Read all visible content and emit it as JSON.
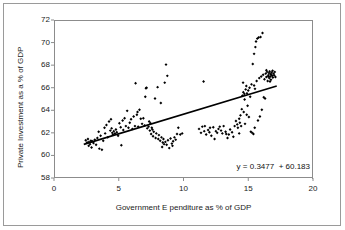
{
  "chart_data": {
    "type": "scatter",
    "title": "",
    "xlabel": "Government E  penditure as % of GDP",
    "ylabel": "Private Investment as a % of GDP",
    "xlim": [
      0,
      20
    ],
    "ylim": [
      58,
      72
    ],
    "xticks": [
      "0",
      "5",
      "10",
      "15",
      "20"
    ],
    "xtick_values": [
      0,
      5,
      10,
      15,
      20
    ],
    "yticks": [
      "58",
      "60",
      "62",
      "64",
      "66",
      "68",
      "70",
      "72"
    ],
    "ytick_values": [
      58,
      60,
      62,
      64,
      66,
      68,
      70,
      72
    ],
    "grid": false,
    "legend": null,
    "marker": "diamond",
    "marker_color": "#000000",
    "annotations": [
      {
        "name": "regression-equation",
        "text": "y = 0.3477  + 60.183",
        "x": 16.2,
        "y": 58.9
      }
    ],
    "trendline": {
      "type": "linear",
      "slope": 0.3477,
      "intercept": 60.183,
      "color": "#000000",
      "x_start": 2.3,
      "x_end": 17.2,
      "y_start": 60.98,
      "y_end": 66.16
    },
    "points": [
      [
        2.45,
        61.35
      ],
      [
        2.55,
        61.15
      ],
      [
        2.62,
        61.45
      ],
      [
        2.7,
        61.2
      ],
      [
        2.78,
        61.0
      ],
      [
        2.85,
        61.3
      ],
      [
        2.9,
        60.7
      ],
      [
        2.95,
        61.25
      ],
      [
        3.05,
        61.1
      ],
      [
        3.15,
        61.4
      ],
      [
        3.25,
        60.95
      ],
      [
        3.35,
        61.55
      ],
      [
        3.45,
        62.1
      ],
      [
        3.5,
        60.6
      ],
      [
        3.6,
        61.75
      ],
      [
        3.7,
        60.5
      ],
      [
        3.8,
        61.3
      ],
      [
        3.95,
        61.95
      ],
      [
        4.05,
        62.7
      ],
      [
        4.15,
        61.6
      ],
      [
        4.25,
        63.0
      ],
      [
        4.35,
        62.2
      ],
      [
        4.45,
        62.4
      ],
      [
        4.5,
        62.0
      ],
      [
        4.55,
        61.85
      ],
      [
        4.62,
        62.15
      ],
      [
        4.7,
        61.95
      ],
      [
        4.78,
        62.3
      ],
      [
        4.85,
        62.05
      ],
      [
        4.95,
        61.75
      ],
      [
        5.05,
        62.85
      ],
      [
        5.15,
        62.5
      ],
      [
        5.2,
        60.9
      ],
      [
        5.3,
        63.1
      ],
      [
        5.45,
        63.3
      ],
      [
        5.55,
        62.6
      ],
      [
        5.65,
        63.95
      ],
      [
        5.75,
        62.45
      ],
      [
        5.85,
        62.9
      ],
      [
        5.95,
        63.2
      ],
      [
        6.05,
        62.35
      ],
      [
        6.15,
        63.45
      ],
      [
        6.25,
        62.6
      ],
      [
        6.3,
        66.4
      ],
      [
        6.4,
        63.6
      ],
      [
        6.5,
        62.55
      ],
      [
        6.6,
        64.05
      ],
      [
        6.7,
        63.25
      ],
      [
        6.8,
        62.8
      ],
      [
        6.9,
        63.3
      ],
      [
        7.0,
        62.65
      ],
      [
        7.05,
        65.2
      ],
      [
        7.1,
        65.95
      ],
      [
        7.15,
        66.0
      ],
      [
        7.2,
        62.4
      ],
      [
        7.3,
        62.55
      ],
      [
        7.35,
        63.0
      ],
      [
        7.4,
        62.2
      ],
      [
        7.5,
        61.9
      ],
      [
        7.55,
        62.45
      ],
      [
        7.6,
        62.3
      ],
      [
        7.65,
        61.7
      ],
      [
        7.7,
        62.1
      ],
      [
        7.8,
        65.05
      ],
      [
        7.85,
        61.55
      ],
      [
        7.9,
        61.95
      ],
      [
        8.0,
        66.05
      ],
      [
        8.05,
        61.45
      ],
      [
        8.1,
        61.8
      ],
      [
        8.2,
        61.3
      ],
      [
        8.25,
        64.65
      ],
      [
        8.3,
        61.6
      ],
      [
        8.4,
        61.15
      ],
      [
        8.45,
        61.45
      ],
      [
        8.5,
        61.0
      ],
      [
        8.55,
        66.45
      ],
      [
        8.6,
        61.2
      ],
      [
        8.65,
        68.05
      ],
      [
        8.7,
        60.95
      ],
      [
        8.75,
        67.05
      ],
      [
        8.8,
        61.35
      ],
      [
        8.9,
        60.65
      ],
      [
        9.0,
        61.5
      ],
      [
        9.1,
        61.05
      ],
      [
        9.2,
        61.25
      ],
      [
        9.3,
        61.6
      ],
      [
        9.4,
        61.4
      ],
      [
        9.5,
        61.9
      ],
      [
        9.6,
        62.45
      ],
      [
        9.75,
        61.85
      ],
      [
        9.9,
        61.95
      ],
      [
        11.2,
        62.35
      ],
      [
        11.35,
        62.0
      ],
      [
        11.45,
        62.55
      ],
      [
        11.55,
        66.55
      ],
      [
        11.6,
        62.15
      ],
      [
        11.75,
        61.85
      ],
      [
        11.9,
        62.25
      ],
      [
        12.0,
        62.05
      ],
      [
        12.15,
        61.75
      ],
      [
        12.3,
        62.5
      ],
      [
        12.4,
        61.45
      ],
      [
        12.5,
        62.15
      ],
      [
        12.6,
        62.0
      ],
      [
        12.7,
        62.35
      ],
      [
        12.8,
        62.55
      ],
      [
        12.9,
        62.2
      ],
      [
        13.0,
        61.95
      ],
      [
        13.1,
        62.6
      ],
      [
        13.25,
        62.1
      ],
      [
        13.4,
        61.55
      ],
      [
        13.5,
        61.85
      ],
      [
        13.6,
        62.3
      ],
      [
        13.75,
        62.05
      ],
      [
        13.85,
        61.65
      ],
      [
        13.95,
        62.6
      ],
      [
        14.05,
        63.05
      ],
      [
        14.15,
        62.75
      ],
      [
        14.2,
        62.45
      ],
      [
        14.3,
        63.25
      ],
      [
        14.35,
        62.9
      ],
      [
        14.4,
        63.55
      ],
      [
        14.45,
        62.6
      ],
      [
        14.5,
        64.1
      ],
      [
        14.55,
        65.3
      ],
      [
        14.6,
        66.45
      ],
      [
        14.62,
        65.6
      ],
      [
        14.65,
        63.85
      ],
      [
        14.7,
        65.45
      ],
      [
        14.72,
        64.95
      ],
      [
        14.75,
        62.8
      ],
      [
        14.8,
        65.85
      ],
      [
        14.85,
        66.15
      ],
      [
        14.9,
        65.5
      ],
      [
        14.95,
        64.4
      ],
      [
        15.0,
        65.75
      ],
      [
        15.05,
        63.4
      ],
      [
        15.1,
        66.0
      ],
      [
        15.15,
        65.2
      ],
      [
        15.2,
        62.1
      ],
      [
        15.25,
        66.3
      ],
      [
        15.3,
        62.0
      ],
      [
        15.35,
        68.1
      ],
      [
        15.4,
        61.9
      ],
      [
        15.45,
        69.0
      ],
      [
        15.5,
        62.45
      ],
      [
        15.55,
        69.6
      ],
      [
        15.6,
        70.1
      ],
      [
        15.65,
        66.6
      ],
      [
        15.7,
        70.35
      ],
      [
        15.75,
        63.1
      ],
      [
        15.8,
        70.45
      ],
      [
        15.85,
        66.85
      ],
      [
        15.9,
        63.45
      ],
      [
        15.95,
        70.5
      ],
      [
        16.0,
        67.0
      ],
      [
        16.05,
        64.05
      ],
      [
        16.1,
        70.85
      ],
      [
        16.15,
        67.15
      ],
      [
        16.2,
        65.15
      ],
      [
        16.25,
        66.75
      ],
      [
        16.3,
        65.05
      ],
      [
        16.35,
        67.25
      ],
      [
        16.4,
        66.95
      ],
      [
        16.45,
        67.4
      ],
      [
        16.5,
        66.6
      ],
      [
        16.55,
        67.1
      ],
      [
        16.6,
        67.3
      ],
      [
        16.62,
        66.85
      ],
      [
        16.65,
        67.45
      ],
      [
        16.7,
        67.0
      ],
      [
        16.72,
        67.2
      ],
      [
        16.75,
        66.7
      ],
      [
        16.8,
        67.35
      ],
      [
        16.85,
        67.05
      ],
      [
        16.88,
        67.5
      ],
      [
        16.9,
        66.9
      ],
      [
        16.95,
        67.25
      ],
      [
        17.0,
        67.1
      ],
      [
        17.05,
        67.4
      ],
      [
        17.1,
        66.95
      ],
      [
        16.4,
        67.55
      ],
      [
        16.55,
        67.0
      ],
      [
        16.68,
        66.55
      ],
      [
        16.78,
        67.15
      ],
      [
        15.45,
        66.2
      ],
      [
        15.52,
        65.9
      ],
      [
        14.88,
        63.6
      ],
      [
        14.3,
        61.95
      ],
      [
        13.3,
        61.9
      ],
      [
        12.05,
        62.45
      ],
      [
        11.65,
        62.6
      ],
      [
        9.15,
        60.85
      ],
      [
        8.35,
        60.75
      ],
      [
        7.45,
        62.85
      ],
      [
        6.45,
        63.85
      ],
      [
        5.35,
        62.25
      ],
      [
        4.4,
        63.2
      ],
      [
        3.9,
        62.45
      ],
      [
        2.68,
        60.85
      ]
    ]
  }
}
